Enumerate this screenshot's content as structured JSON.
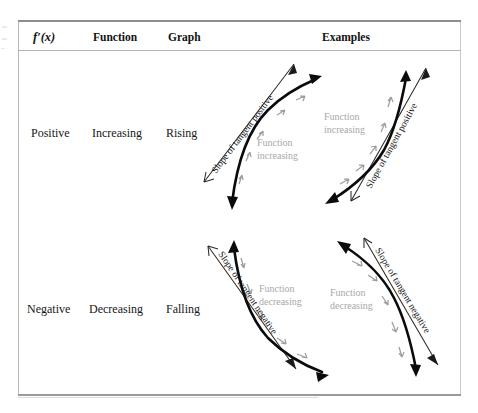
{
  "table": {
    "headers": [
      {
        "key": "derivative",
        "label": "f′(x)"
      },
      {
        "key": "function",
        "label": "Function"
      },
      {
        "key": "graph",
        "label": "Graph"
      },
      {
        "key": "examples",
        "label": "Examples"
      }
    ],
    "rows": [
      {
        "derivative": "Positive",
        "function": "Increasing",
        "graph": "Rising",
        "examples": [
          {
            "id": "top-left",
            "shape": "concave-down-rising",
            "tangent_label": "Slope of tangent positive",
            "tangent_label_rotation_deg": -55,
            "function_label_line1": "Function",
            "function_label_line2": "increasing"
          },
          {
            "id": "top-right",
            "shape": "concave-up-rising",
            "tangent_label": "Slope of tangent positive",
            "tangent_label_rotation_deg": -62,
            "function_label_line1": "Function",
            "function_label_line2": "increasing"
          }
        ]
      },
      {
        "derivative": "Negative",
        "function": "Decreasing",
        "graph": "Falling",
        "examples": [
          {
            "id": "bottom-left",
            "shape": "convex-falling",
            "tangent_label": "Slope of tangent negative",
            "tangent_label_rotation_deg": 58,
            "function_label_line1": "Function",
            "function_label_line2": "decreasing"
          },
          {
            "id": "bottom-right",
            "shape": "concave-falling",
            "tangent_label": "Slope of tangent negative",
            "tangent_label_rotation_deg": 60,
            "function_label_line1": "Function",
            "function_label_line2": "decreasing"
          }
        ]
      }
    ]
  },
  "colors": {
    "curve": "#0b0b0b",
    "tangent": "#2a2a2a",
    "direction_arrow": "#9e9e9e",
    "annotation_text": "#a8a8a8",
    "rule": "#8d8d8d",
    "page_background": "#ffffff"
  }
}
